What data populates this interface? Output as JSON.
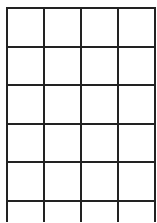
{
  "grid": {
    "columns": 4,
    "rows": 6,
    "line_color": "#222222",
    "background_color": "#ffffff",
    "cells": [
      [
        "",
        "",
        "",
        ""
      ],
      [
        "",
        "",
        "",
        ""
      ],
      [
        "",
        "",
        "",
        ""
      ],
      [
        "",
        "",
        "",
        ""
      ],
      [
        "",
        "",
        "",
        ""
      ],
      [
        "",
        "",
        "",
        ""
      ]
    ]
  }
}
